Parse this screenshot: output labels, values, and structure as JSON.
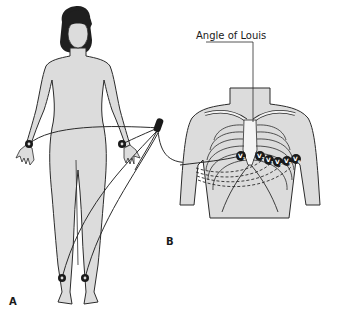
{
  "diagram": {
    "colors": {
      "skin": "#dcdcdc",
      "outline": "#2b2b2b",
      "hair": "#1f1f1f",
      "electrode": "#1a1a1a",
      "rib": "#f2f2f2",
      "background": "#ffffff"
    },
    "panels": [
      {
        "id": "A",
        "label": "A",
        "description": "Full body with limb electrodes"
      },
      {
        "id": "B",
        "label": "B",
        "description": "Chest with precordial electrodes"
      }
    ],
    "callouts": {
      "angle_of_louis": "Angle of Louis"
    },
    "limb_electrodes": [
      {
        "name": "right-wrist"
      },
      {
        "name": "left-wrist"
      },
      {
        "name": "right-ankle"
      },
      {
        "name": "left-ankle"
      }
    ],
    "precordial_leads": [
      {
        "label": "V",
        "sub": "1"
      },
      {
        "label": "V",
        "sub": "2"
      },
      {
        "label": "V",
        "sub": "3"
      },
      {
        "label": "V",
        "sub": "4"
      },
      {
        "label": "V",
        "sub": "5"
      },
      {
        "label": "V",
        "sub": "6"
      }
    ]
  }
}
